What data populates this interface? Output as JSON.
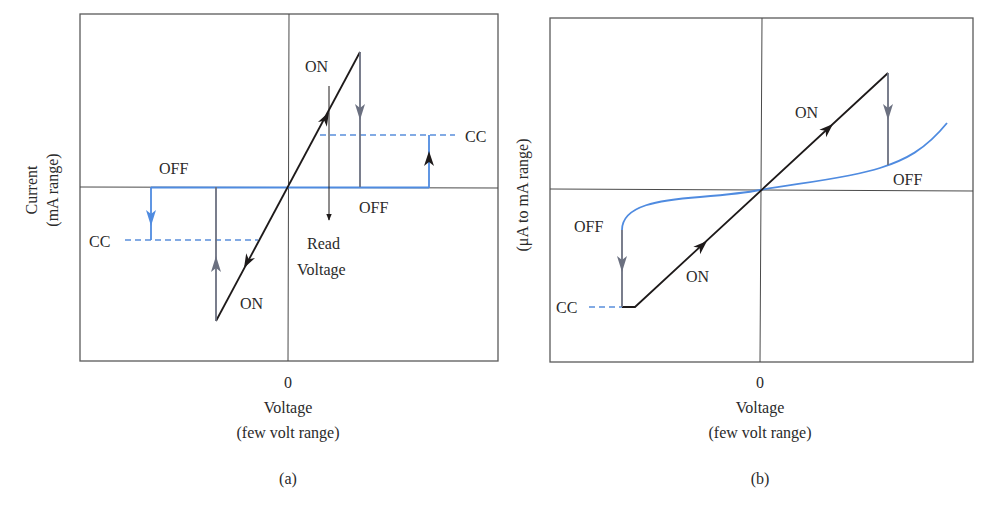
{
  "colors": {
    "axis": "#4a4a4a",
    "on_path": "#1e1a1a",
    "off_drop": "#6b7080",
    "off_state": "#4f8be0",
    "cc_dash": "#5a8fdc"
  },
  "panel_a": {
    "y_label_line1": "Current",
    "y_label_line2": "(mA range)",
    "x_zero": "0",
    "x_label_line1": "Voltage",
    "x_label_line2": "(few volt range)",
    "caption": "(a)",
    "labels": {
      "on_top": "ON",
      "on_bottom": "ON",
      "off_left": "OFF",
      "off_right": "OFF",
      "cc_left": "CC",
      "cc_right": "CC",
      "read_voltage_line1": "Read",
      "read_voltage_line2": "Voltage"
    }
  },
  "panel_b": {
    "y_label": "(μA to mA range)",
    "x_zero": "0",
    "x_label_line1": "Voltage",
    "x_label_line2": "(few volt range)",
    "caption": "(b)",
    "labels": {
      "on_top": "ON",
      "on_bottom": "ON",
      "off_left": "OFF",
      "off_right": "OFF",
      "cc_left": "CC"
    }
  }
}
